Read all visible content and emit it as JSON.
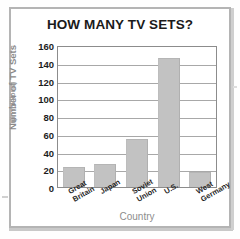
{
  "chart_data": {
    "type": "bar",
    "title": "HOW MANY TV SETS?",
    "xlabel": "Country",
    "ylabel": "Number of TV Sets",
    "ylabel_sub": "(in millions)",
    "categories": [
      "Great Britain",
      "Japan",
      "Soviet Union",
      "U.S.",
      "West Germany"
    ],
    "category_lines": [
      [
        "Great",
        "Britain"
      ],
      [
        "Japan"
      ],
      [
        "Soviet",
        "Union"
      ],
      [
        "U.S."
      ],
      [
        "West",
        "Germany"
      ]
    ],
    "values": [
      22,
      26,
      54,
      145,
      17
    ],
    "ylim": [
      0,
      160
    ],
    "yticks": [
      0,
      20,
      40,
      60,
      80,
      100,
      120,
      140,
      160
    ],
    "grid": true,
    "legend": "none",
    "colors": {
      "bar": "#c2c2c2",
      "axis": "#8c8c8c",
      "grid": "#a8a8a8",
      "title_text": "#1a1a1a",
      "axis_title_text": "#8d8d8d",
      "tick_text": "#1d1d1d",
      "frame": "#b4b4b4",
      "background": "#ffffff"
    }
  }
}
